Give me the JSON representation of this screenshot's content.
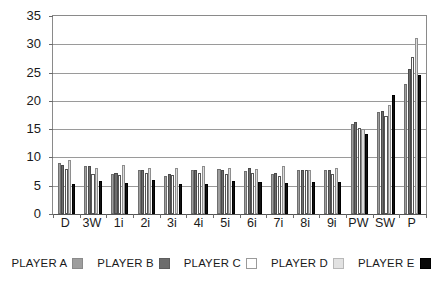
{
  "chart_data": {
    "type": "bar",
    "title": "",
    "subtitle": "",
    "xlabel": "",
    "ylabel": "",
    "ylim": [
      0,
      35
    ],
    "yticks": [
      0,
      5,
      10,
      15,
      20,
      25,
      30,
      35
    ],
    "grid": true,
    "legend_position": "bottom",
    "categories": [
      "D",
      "3W",
      "1i",
      "2i",
      "3i",
      "4i",
      "5i",
      "6i",
      "7i",
      "8i",
      "9i",
      "PW",
      "SW",
      "P"
    ],
    "series": [
      {
        "name": "PLAYER A",
        "color": "#9e9e9e",
        "values": [
          9.1,
          8.5,
          7.1,
          7.7,
          6.8,
          7.7,
          7.9,
          7.6,
          7.1,
          7.7,
          7.8,
          16.0,
          18.1,
          23.0
        ]
      },
      {
        "name": "PLAYER B",
        "color": "#6d6d6d",
        "values": [
          8.7,
          8.4,
          7.3,
          7.8,
          7.0,
          7.8,
          7.7,
          8.1,
          7.3,
          7.8,
          7.8,
          16.2,
          18.2,
          25.6
        ]
      },
      {
        "name": "PLAYER C",
        "color": "#ffffff",
        "values": [
          7.9,
          7.0,
          6.9,
          7.3,
          6.9,
          7.3,
          7.1,
          7.3,
          6.8,
          7.7,
          7.1,
          15.2,
          17.3,
          27.7
        ]
      },
      {
        "name": "PLAYER D",
        "color": "#dcdcdc",
        "values": [
          9.5,
          8.1,
          8.6,
          8.1,
          8.1,
          8.5,
          8.1,
          7.9,
          8.5,
          7.7,
          8.1,
          15.0,
          19.2,
          31.2
        ]
      },
      {
        "name": "PLAYER E",
        "color": "#121212",
        "values": [
          5.3,
          5.9,
          5.4,
          6.1,
          5.3,
          5.3,
          5.9,
          5.7,
          5.4,
          5.6,
          5.6,
          14.2,
          21.1,
          24.6
        ]
      }
    ]
  },
  "legend": {
    "items": [
      {
        "label": "PLAYER A",
        "swatch_class": "sw-pA"
      },
      {
        "label": "PLAYER B",
        "swatch_class": "sw-pB"
      },
      {
        "label": "PLAYER C",
        "swatch_class": "sw-pC"
      },
      {
        "label": "PLAYER D",
        "swatch_class": "sw-pD"
      },
      {
        "label": "PLAYER E",
        "swatch_class": "sw-pE"
      }
    ]
  }
}
